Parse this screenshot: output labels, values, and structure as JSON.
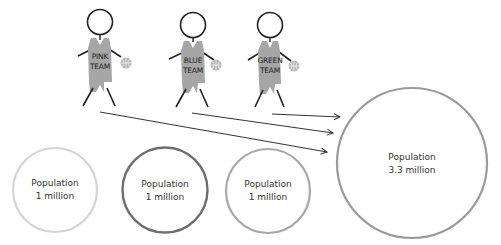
{
  "figures": [
    {
      "team_line1": "PINK",
      "team_line2": "TEAM",
      "cx": 100,
      "jersey_color": "#a6a6a6"
    },
    {
      "team_line1": "BLUE",
      "team_line2": "TEAM",
      "cx": 193,
      "jersey_color": "#a6a6a6"
    },
    {
      "team_line1": "GREEN",
      "team_line2": "TEAM",
      "cx": 270,
      "jersey_color": "#a6a6a6"
    }
  ],
  "circles": [
    {
      "line1": "Population",
      "line2": "1 million",
      "stroke": "#d4d4d4"
    },
    {
      "line1": "Population",
      "line2": "1 million",
      "stroke": "#6e6e6e"
    },
    {
      "line1": "Population",
      "line2": "1 million",
      "stroke": "#a8a8a8"
    },
    {
      "line1": "Population",
      "line2": "3.3 million",
      "stroke": "#9a9a9a"
    }
  ],
  "colors": {
    "line": "#222222",
    "ball": "#b0b0b0",
    "arrow": "#333333"
  }
}
